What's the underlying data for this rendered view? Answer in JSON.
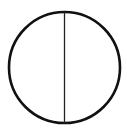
{
  "diagram": {
    "shape": "circle-with-vertical-diameter",
    "circle": {
      "cx": 64.5,
      "cy": 67.5,
      "r": 55.5,
      "stroke": "#111111",
      "stroke_width": 2.6,
      "fill": "#ffffff"
    },
    "diameter": {
      "x1": 64.5,
      "y1": 12,
      "x2": 64.5,
      "y2": 123,
      "stroke": "#222222",
      "stroke_width": 1.3
    }
  }
}
